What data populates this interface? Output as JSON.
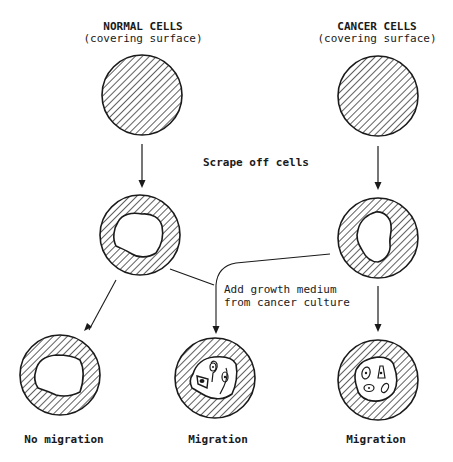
{
  "diagram": {
    "columns": {
      "normal": {
        "title": "NORMAL CELLS",
        "subtitle": "(covering surface)"
      },
      "cancer": {
        "title": "CANCER CELLS",
        "subtitle": "(covering surface)"
      }
    },
    "steps": {
      "scrape": "Scrape off cells",
      "add_medium_line1": "Add growth medium",
      "add_medium_line2": "from cancer culture"
    },
    "outcomes": {
      "left": "No migration",
      "middle": "Migration",
      "right": "Migration"
    },
    "colors": {
      "ink": "#1a1a1a",
      "background": "#ffffff"
    }
  }
}
